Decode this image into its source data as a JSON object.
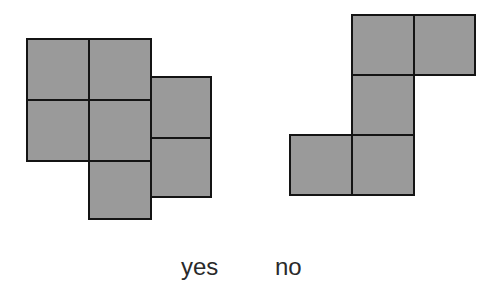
{
  "diagram": {
    "shapes": [
      {
        "id": "yes-shape",
        "label": "yes",
        "cells": [
          {
            "x": 26,
            "y": 38,
            "w": 64,
            "h": 63
          },
          {
            "x": 88,
            "y": 38,
            "w": 64,
            "h": 63
          },
          {
            "x": 26,
            "y": 99,
            "w": 64,
            "h": 63
          },
          {
            "x": 88,
            "y": 99,
            "w": 64,
            "h": 63
          },
          {
            "x": 88,
            "y": 160,
            "w": 64,
            "h": 60
          },
          {
            "x": 150,
            "y": 76,
            "w": 62,
            "h": 63
          },
          {
            "x": 150,
            "y": 137,
            "w": 62,
            "h": 61
          }
        ]
      },
      {
        "id": "no-shape",
        "label": "no",
        "cells": [
          {
            "x": 351,
            "y": 14,
            "w": 64,
            "h": 62
          },
          {
            "x": 413,
            "y": 14,
            "w": 63,
            "h": 62
          },
          {
            "x": 351,
            "y": 74,
            "w": 64,
            "h": 62
          },
          {
            "x": 289,
            "y": 134,
            "w": 64,
            "h": 62
          },
          {
            "x": 351,
            "y": 134,
            "w": 64,
            "h": 62
          }
        ]
      }
    ],
    "labels": {
      "yes": "yes",
      "no": "no"
    },
    "colors": {
      "cell_fill": "#9a9a9a",
      "cell_border": "#141414",
      "text": "#2a2a2a"
    }
  }
}
